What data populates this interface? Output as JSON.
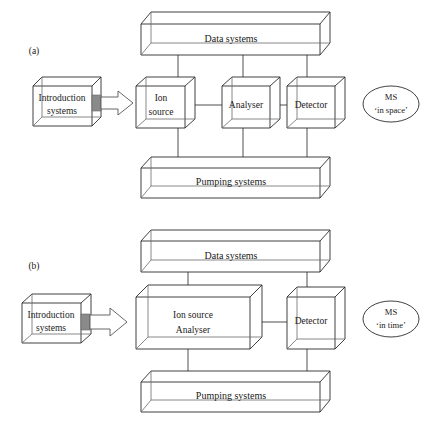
{
  "figure": {
    "background_color": "#ffffff",
    "line_color": "#2b2b2b",
    "plug_color": "#8a8a8a"
  },
  "panels": [
    {
      "id": "a",
      "label": "(a)",
      "caption": "MS 'in space'",
      "ellipse": {
        "line1": "MS",
        "line2": "‘in space’"
      },
      "top_bar": {
        "label": "Data systems"
      },
      "bottom_bar": {
        "label": "Pumping systems"
      },
      "source_box": {
        "line1": "Introduction",
        "line2": "systems"
      },
      "chain": [
        {
          "line1": "Ion",
          "line2": "source"
        },
        {
          "line1": "Analyser",
          "line2": ""
        },
        {
          "line1": "Detector",
          "line2": ""
        }
      ]
    },
    {
      "id": "b",
      "label": "(b)",
      "caption": "MS 'in time'",
      "ellipse": {
        "line1": "MS",
        "line2": "‘in time’"
      },
      "top_bar": {
        "label": "Data systems"
      },
      "bottom_bar": {
        "label": "Pumping systems"
      },
      "source_box": {
        "line1": "Introduction",
        "line2": "systems"
      },
      "chain": [
        {
          "line1": "Ion source",
          "line2": "Analyser"
        },
        {
          "line1": "Detector",
          "line2": ""
        }
      ]
    }
  ]
}
